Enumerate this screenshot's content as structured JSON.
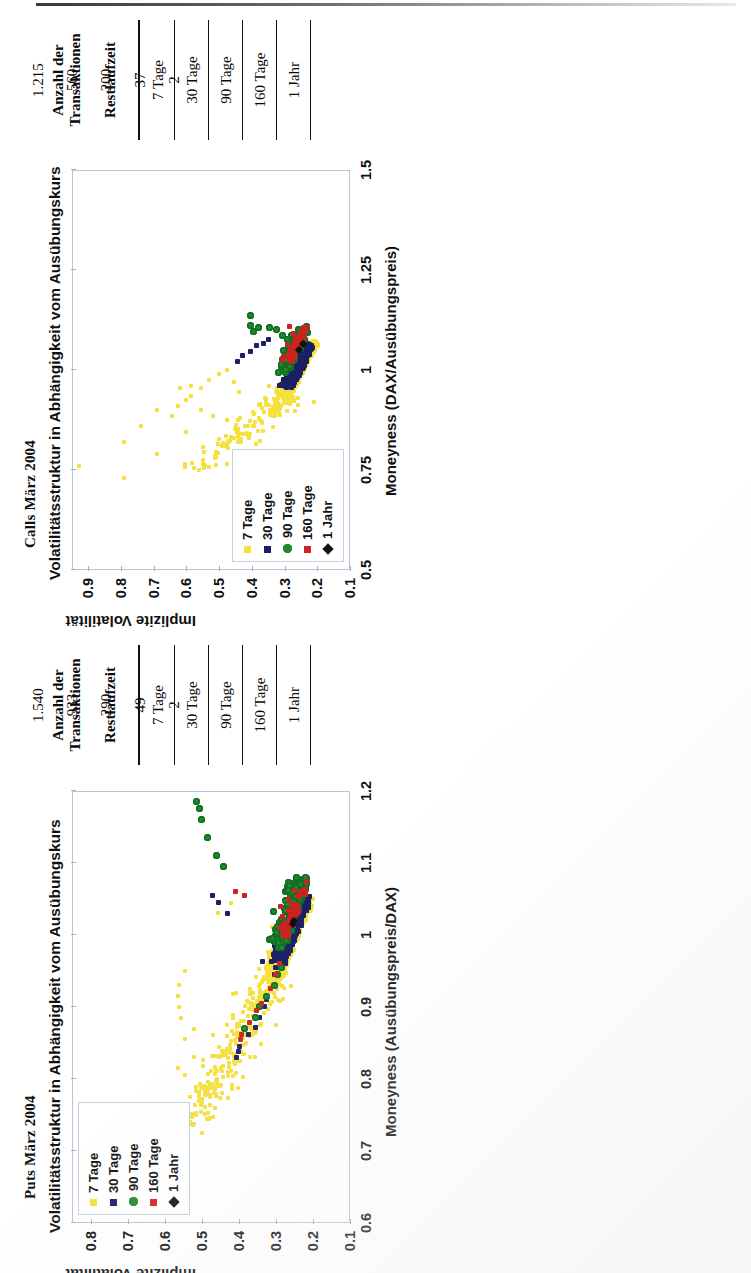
{
  "page": {
    "type": "scanned-document-page",
    "orientation": "landscape-content-rotated-90ccw"
  },
  "figures": [
    {
      "id": "calls",
      "title": "Calls März 2004",
      "subtitle": "Volatilitätsstruktur in Abhängigkeit vom Ausübungskurs",
      "chart_data": {
        "type": "scatter",
        "title": "Calls März 2004",
        "subtitle": "Volatilitätsstruktur in Abhängigkeit vom Ausübungskurs",
        "xlabel": "Moneyness (DAX/Ausübungspreis)",
        "ylabel": "Implizite Volatilität",
        "xlim": [
          0.5,
          1.5
        ],
        "ylim": [
          0.1,
          0.95
        ],
        "xticks": [
          "0.5",
          "0.75",
          "1",
          "1.25",
          "1.5"
        ],
        "xtickvals": [
          0.5,
          0.75,
          1,
          1.25,
          1.5
        ],
        "yticks": [
          "0.9",
          "0.8",
          "0.7",
          "0.6",
          "0.5",
          "0.4",
          "0.3",
          "0.2",
          "0.1"
        ],
        "ytickvals": [
          0.9,
          0.8,
          0.7,
          0.6,
          0.5,
          0.4,
          0.3,
          0.2,
          0.1
        ],
        "grid": false,
        "legend_position": "top-left-inside",
        "series": [
          {
            "name": "7 Tage",
            "color": "#f5e03c",
            "marker": "square",
            "size": 4
          },
          {
            "name": "30 Tage",
            "color": "#1b1f66",
            "marker": "square",
            "size": 5
          },
          {
            "name": "90 Tage",
            "color": "#1f8a2e",
            "marker": "circle",
            "size": 7
          },
          {
            "name": "160 Tage",
            "color": "#cc2222",
            "marker": "square",
            "size": 5
          },
          {
            "name": "1 Jahr",
            "color": "#111111",
            "marker": "diamond",
            "size": 6
          }
        ]
      },
      "table": {
        "col_headers": [
          "Restlaufzeit",
          "Anzahl der Transaktionen"
        ],
        "rows": [
          {
            "label": "7 Tage",
            "value": "1.215"
          },
          {
            "label": "30 Tage",
            "value": "560"
          },
          {
            "label": "90 Tage",
            "value": "200"
          },
          {
            "label": "160 Tage",
            "value": "37"
          },
          {
            "label": "1 Jahr",
            "value": "2"
          }
        ]
      }
    },
    {
      "id": "puts",
      "title": "Puts März 2004",
      "subtitle": "Volatilitätsstruktur in Abhängigkeit vom Ausübungskurs",
      "chart_data": {
        "type": "scatter",
        "title": "Puts März 2004",
        "subtitle": "Volatilitätsstruktur in Abhängigkeit vom Ausübungskurs",
        "xlabel": "Moneyness (Ausübungspreis/DAX)",
        "ylabel": "Implizite Volatilität",
        "xlim": [
          0.6,
          1.2
        ],
        "ylim": [
          0.1,
          0.85
        ],
        "xticks": [
          "0.6",
          "0.7",
          "0.8",
          "0.9",
          "1",
          "1.1",
          "1.2"
        ],
        "xtickvals": [
          0.6,
          0.7,
          0.8,
          0.9,
          1,
          1.1,
          1.2
        ],
        "yticks": [
          "0.8",
          "0.7",
          "0.6",
          "0.5",
          "0.4",
          "0.3",
          "0.2",
          "0.1"
        ],
        "ytickvals": [
          0.8,
          0.7,
          0.6,
          0.5,
          0.4,
          0.3,
          0.2,
          0.1
        ],
        "grid": false,
        "legend_position": "top-left-inside",
        "series": [
          {
            "name": "7 Tage",
            "color": "#f5e03c",
            "marker": "square",
            "size": 4
          },
          {
            "name": "30 Tage",
            "color": "#1b1f66",
            "marker": "square",
            "size": 5
          },
          {
            "name": "90 Tage",
            "color": "#1f8a2e",
            "marker": "circle",
            "size": 7
          },
          {
            "name": "160 Tage",
            "color": "#cc2222",
            "marker": "square",
            "size": 5
          },
          {
            "name": "1 Jahr",
            "color": "#111111",
            "marker": "diamond",
            "size": 6
          }
        ]
      },
      "table": {
        "col_headers": [
          "Restlaufzeit",
          "Anzahl der Transaktionen"
        ],
        "rows": [
          {
            "label": "7 Tage",
            "value": "1.540"
          },
          {
            "label": "30 Tage",
            "value": "933"
          },
          {
            "label": "90 Tage",
            "value": "290"
          },
          {
            "label": "160 Tage",
            "value": "49"
          },
          {
            "label": "1 Jahr",
            "value": "2"
          }
        ]
      }
    }
  ],
  "colors": {
    "tage7": "#f5e03c",
    "tage30": "#1b1f66",
    "tage90": "#1f8a2e",
    "tage160": "#cc2222",
    "jahr1": "#111111",
    "plot_border": "#b9c6d6"
  }
}
